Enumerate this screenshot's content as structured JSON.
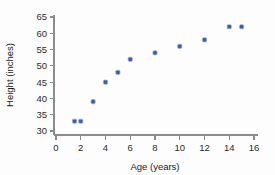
{
  "chart_data": {
    "type": "scatter",
    "title": "",
    "xlabel": "Age (years)",
    "ylabel": "Height (inches)",
    "xlim": [
      0,
      16
    ],
    "ylim": [
      30,
      65
    ],
    "xticks": [
      0,
      2,
      4,
      6,
      8,
      10,
      12,
      14,
      16
    ],
    "yticks": [
      30,
      35,
      40,
      45,
      50,
      55,
      60,
      65
    ],
    "grid": false,
    "legend": false,
    "marker_color": "#3b5ca8",
    "marker_edge_color": "#9fb3dd",
    "axis_color": "#8c8c8c",
    "background_color": "#fdfdfd",
    "series": [
      {
        "name": "height vs age",
        "points": [
          {
            "x": 1.5,
            "y": 33
          },
          {
            "x": 2,
            "y": 33
          },
          {
            "x": 3,
            "y": 39
          },
          {
            "x": 4,
            "y": 45
          },
          {
            "x": 5,
            "y": 48
          },
          {
            "x": 6,
            "y": 52
          },
          {
            "x": 8,
            "y": 54
          },
          {
            "x": 10,
            "y": 56
          },
          {
            "x": 12,
            "y": 58
          },
          {
            "x": 14,
            "y": 62
          },
          {
            "x": 15,
            "y": 62
          }
        ]
      }
    ]
  },
  "axis_labels": {
    "x_title": "Age (years)",
    "y_title": "Height (inches)"
  },
  "x_tick_labels": [
    "0",
    "2",
    "4",
    "6",
    "8",
    "10",
    "12",
    "14",
    "16"
  ],
  "y_tick_labels": [
    "30",
    "35",
    "40",
    "45",
    "50",
    "55",
    "60",
    "65"
  ]
}
